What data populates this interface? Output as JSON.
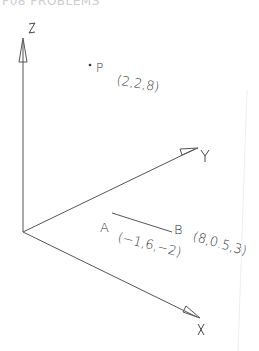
{
  "header": {
    "cut_title": "P08 PROBLEMS"
  },
  "axes": {
    "origin": [
      23,
      232
    ],
    "z": {
      "label": "Z",
      "tip": [
        23,
        40
      ]
    },
    "y": {
      "label": "Y",
      "tip": [
        198,
        148
      ]
    },
    "x": {
      "label": "X",
      "tip": [
        200,
        318
      ]
    }
  },
  "points": {
    "p": {
      "name": "P",
      "coords": "(2,2,8)"
    },
    "a": {
      "name": "A",
      "coords": "(−1,6,−2)"
    },
    "b": {
      "name": "B",
      "coords": "(8,0.5,3)"
    }
  },
  "colors": {
    "line": "#555555",
    "text": "#333333"
  }
}
